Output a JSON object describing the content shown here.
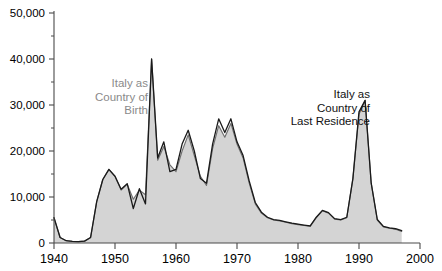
{
  "chart_data": {
    "type": "area",
    "title": "",
    "xlabel": "",
    "ylabel": "",
    "xlim": [
      1940,
      2000
    ],
    "ylim": [
      0,
      50000
    ],
    "grid": false,
    "legend_position": "inline-annotations",
    "x_ticks": [
      "1940",
      "1950",
      "1960",
      "1970",
      "1980",
      "1990",
      "2000"
    ],
    "x_tick_values": [
      1940,
      1950,
      1960,
      1970,
      1980,
      1990,
      2000
    ],
    "y_ticks": [
      "0",
      "10,000",
      "20,000",
      "30,000",
      "40,000",
      "50,000"
    ],
    "y_tick_values": [
      0,
      10000,
      20000,
      30000,
      40000,
      50000
    ],
    "y_minor_tick_values": [
      5000,
      15000,
      25000,
      35000,
      45000
    ],
    "colors": {
      "area_fill": "#d4d4d4",
      "birth_line": "#6f6f6f",
      "residence_line": "#1a1a1a",
      "axis": "#4a4a4a",
      "annotation_birth": "#8a8a8a",
      "annotation_residence": "#121212"
    },
    "series": [
      {
        "name": "Italy as Country of Birth",
        "style": "filled-area",
        "x": [
          1940,
          1941,
          1942,
          1943,
          1944,
          1945,
          1946,
          1947,
          1948,
          1949,
          1950,
          1951,
          1952,
          1953,
          1954,
          1955,
          1956,
          1957,
          1958,
          1959,
          1960,
          1961,
          1962,
          1963,
          1964,
          1965,
          1966,
          1967,
          1968,
          1969,
          1970,
          1971,
          1972,
          1973,
          1974,
          1975,
          1976,
          1977,
          1978,
          1979,
          1980,
          1981,
          1982,
          1983,
          1984,
          1985,
          1986,
          1987,
          1988,
          1989,
          1990,
          1991,
          1992,
          1993,
          1994,
          1995,
          1996,
          1997
        ],
        "values": [
          5500,
          1200,
          500,
          350,
          300,
          400,
          1200,
          9000,
          13800,
          16000,
          14500,
          11500,
          12800,
          9500,
          11500,
          10500,
          40000,
          18000,
          21000,
          17000,
          15500,
          20000,
          23500,
          19000,
          14500,
          12500,
          20500,
          25500,
          23000,
          26000,
          21500,
          18500,
          13000,
          8500,
          6500,
          5500,
          5000,
          4800,
          4500,
          4200,
          4000,
          3800,
          3600,
          5500,
          7000,
          6500,
          5200,
          5000,
          5500,
          14000,
          28000,
          31000,
          13000,
          5000,
          3500,
          3200,
          3000,
          2500
        ]
      },
      {
        "name": "Italy as Country of Last Residence",
        "style": "line",
        "x": [
          1940,
          1941,
          1942,
          1943,
          1944,
          1945,
          1946,
          1947,
          1948,
          1949,
          1950,
          1951,
          1952,
          1953,
          1954,
          1955,
          1956,
          1957,
          1958,
          1959,
          1960,
          1961,
          1962,
          1963,
          1964,
          1965,
          1966,
          1967,
          1968,
          1969,
          1970,
          1971,
          1972,
          1973,
          1974,
          1975,
          1976,
          1977,
          1978,
          1979,
          1980,
          1981,
          1982,
          1983,
          1984,
          1985,
          1986,
          1987,
          1988,
          1989,
          1990,
          1991,
          1992,
          1993,
          1994,
          1995,
          1996,
          1997
        ],
        "values": [
          5500,
          1200,
          500,
          350,
          300,
          400,
          1200,
          9000,
          13800,
          16000,
          14500,
          11700,
          12900,
          7500,
          11800,
          8500,
          40000,
          18500,
          22000,
          15500,
          16000,
          21500,
          24500,
          20000,
          14000,
          13000,
          21500,
          27000,
          24000,
          27000,
          22000,
          19000,
          13500,
          8800,
          6700,
          5600,
          5100,
          4900,
          4600,
          4300,
          4100,
          3900,
          3700,
          5600,
          7100,
          6600,
          5300,
          5100,
          5600,
          14000,
          28500,
          31000,
          13000,
          5100,
          3600,
          3300,
          3100,
          2700
        ]
      }
    ],
    "annotations": [
      {
        "id": "annotation-birth",
        "lines": [
          "Italy as",
          "Country of",
          "Birth"
        ],
        "color": "#8a8a8a",
        "anchor_x": 148,
        "anchor_y": 87
      },
      {
        "id": "annotation-residence",
        "lines": [
          "Italy as",
          "Country of",
          "Last Residence"
        ],
        "color": "#121212",
        "anchor_x": 370,
        "anchor_y": 98
      }
    ]
  }
}
